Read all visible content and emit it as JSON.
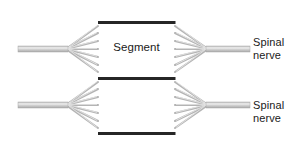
{
  "diagram": {
    "type": "anatomical-schematic",
    "background_color": "#ffffff",
    "cord_line_color": "#2b2b2b",
    "nerve_color": "#b0b0b0",
    "nerve_highlight_color": "#e8e8e8",
    "text_color": "#1a1a1a",
    "labels": {
      "segment": "Segment",
      "spinal_nerve_top": "Spinal\nnerve",
      "spinal_nerve_bottom": "Spinal\nnerve"
    },
    "cord": {
      "left_edge_x": 98,
      "right_edge_x": 175,
      "top_y": 4,
      "bottom_y": 157,
      "divider_y": [
        22,
        78,
        133
      ],
      "line_width": 3.4
    },
    "nerve_rows": [
      {
        "name": "upper-nerve-row",
        "axis_y": 49,
        "rootlet_count": 6,
        "left_trunk_start_x": 18,
        "left_fan_apex_x": 66,
        "right_fan_apex_x": 208,
        "right_trunk_end_x": 250
      },
      {
        "name": "lower-nerve-row",
        "axis_y": 105,
        "rootlet_count": 6,
        "left_trunk_start_x": 18,
        "left_fan_apex_x": 66,
        "right_fan_apex_x": 208,
        "right_trunk_end_x": 250
      }
    ]
  }
}
